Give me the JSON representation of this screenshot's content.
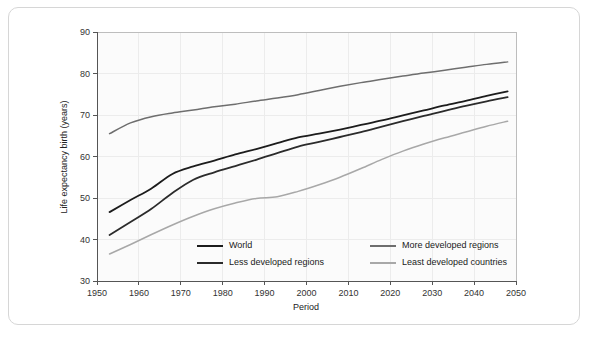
{
  "figure": {
    "axis_title_x": "Period",
    "axis_title_y": "Life expectancy birth (years)"
  },
  "chart_data": {
    "type": "line",
    "title": "",
    "xlabel": "Period",
    "ylabel": "Life expectancy birth (years)",
    "xlim": [
      1950,
      2050
    ],
    "ylim": [
      30,
      90
    ],
    "xticks": [
      1950,
      1960,
      1970,
      1980,
      1990,
      2000,
      2010,
      2020,
      2030,
      2040,
      2050
    ],
    "yticks": [
      30,
      40,
      50,
      60,
      70,
      80,
      90
    ],
    "xtick_labels": [
      "1950",
      "1960",
      "1970",
      "1980",
      "1990",
      "2000",
      "2010",
      "2020",
      "2030",
      "2040",
      "2050"
    ],
    "ytick_labels": [
      "30",
      "40",
      "50",
      "60",
      "70",
      "80",
      "90"
    ],
    "grid": "faint vertical and horizontal gridlines",
    "legend_position": "inside lower-center, two columns",
    "x": [
      1953,
      1958,
      1963,
      1968,
      1973,
      1978,
      1983,
      1988,
      1993,
      1998,
      2003,
      2008,
      2013,
      2018,
      2023,
      2028,
      2033,
      2038,
      2043,
      2048
    ],
    "series": [
      {
        "name": "World",
        "color": "#1c1c1c",
        "values": [
          46.6,
          49.5,
          52.3,
          55.8,
          57.6,
          59.0,
          60.5,
          61.8,
          63.2,
          64.6,
          65.5,
          66.5,
          67.6,
          68.7,
          69.9,
          71.1,
          72.3,
          73.4,
          74.6,
          75.7
        ]
      },
      {
        "name": "Less developed regions",
        "color": "#2b2b2b",
        "values": [
          41.1,
          44.2,
          47.4,
          51.2,
          54.4,
          56.2,
          57.7,
          59.2,
          60.8,
          62.4,
          63.5,
          64.7,
          65.9,
          67.2,
          68.5,
          69.8,
          71.0,
          72.2,
          73.3,
          74.3
        ]
      },
      {
        "name": "More developed regions",
        "color": "#6e6e6e",
        "values": [
          65.5,
          68.1,
          69.6,
          70.5,
          71.2,
          72.0,
          72.6,
          73.4,
          74.1,
          74.9,
          75.9,
          76.9,
          77.8,
          78.6,
          79.4,
          80.1,
          80.8,
          81.5,
          82.2,
          82.8
        ]
      },
      {
        "name": "Least developed countries",
        "color": "#a8a8a8",
        "values": [
          36.5,
          38.8,
          41.2,
          43.5,
          45.6,
          47.4,
          48.8,
          49.9,
          50.3,
          51.6,
          53.2,
          55.0,
          57.1,
          59.3,
          61.3,
          63.0,
          64.5,
          65.9,
          67.3,
          68.5
        ]
      }
    ],
    "legend": [
      {
        "label": "World",
        "color": "#1c1c1c"
      },
      {
        "label": "More developed regions",
        "color": "#6e6e6e"
      },
      {
        "label": "Less developed regions",
        "color": "#2b2b2b"
      },
      {
        "label": "Least developed countries",
        "color": "#a8a8a8"
      }
    ]
  }
}
